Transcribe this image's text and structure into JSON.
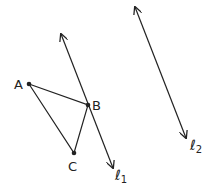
{
  "points": {
    "A": {
      "label": "A",
      "x": 29,
      "y": 84
    },
    "B": {
      "label": "B",
      "x": 88,
      "y": 105
    },
    "C": {
      "label": "C",
      "x": 74,
      "y": 153
    }
  },
  "lines": [
    {
      "name": "l1",
      "label": "ℓ",
      "subscript": "1",
      "x1": 61,
      "y1": 34,
      "x2": 113,
      "y2": 168
    },
    {
      "name": "l2",
      "label": "ℓ",
      "subscript": "2",
      "x1": 135,
      "y1": 7,
      "x2": 186,
      "y2": 138
    }
  ],
  "colors": {
    "stroke": "#222222",
    "background": "#ffffff"
  }
}
